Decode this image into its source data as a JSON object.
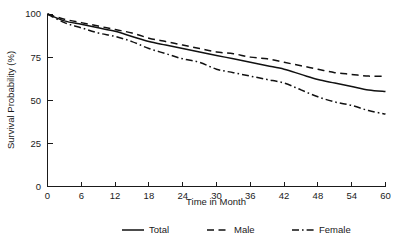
{
  "chart_data": {
    "type": "line",
    "title": "",
    "subtitle": "",
    "xlabel": "Time in Month",
    "ylabel": "Survival Probability (%)",
    "xlim": [
      0,
      60
    ],
    "ylim": [
      0,
      100
    ],
    "xticks": [
      0,
      6,
      12,
      18,
      24,
      30,
      36,
      42,
      48,
      54,
      60
    ],
    "xtick_labels": [
      "0",
      "6",
      "12",
      "18",
      "24",
      "30",
      "36",
      "42",
      "48",
      "54",
      "60"
    ],
    "yticks": [
      0,
      25,
      50,
      75,
      100
    ],
    "ytick_labels": [
      "0",
      "25",
      "50",
      "75",
      "100"
    ],
    "grid": false,
    "legend_position": "bottom",
    "x": [
      0,
      3,
      6,
      9,
      12,
      15,
      18,
      21,
      24,
      27,
      30,
      33,
      36,
      39,
      42,
      45,
      48,
      51,
      54,
      57,
      60
    ],
    "series": [
      {
        "name": "Total",
        "style": "solid",
        "color": "#111111",
        "values": [
          100,
          96,
          94,
          92,
          90,
          87,
          84,
          82,
          80,
          78,
          76,
          74,
          72,
          70,
          68,
          65,
          62,
          60,
          58,
          56,
          55
        ]
      },
      {
        "name": "Male",
        "style": "dashed",
        "color": "#111111",
        "values": [
          100,
          97,
          95,
          93,
          91,
          89,
          86,
          84,
          82,
          80,
          78,
          77,
          75,
          74,
          72,
          70,
          68,
          66,
          65,
          64,
          64
        ]
      },
      {
        "name": "Female",
        "style": "dashdot",
        "color": "#111111",
        "values": [
          100,
          95,
          92,
          89,
          87,
          84,
          80,
          77,
          74,
          72,
          68,
          66,
          64,
          62,
          60,
          56,
          52,
          49,
          47,
          44,
          42
        ]
      }
    ]
  },
  "axes": {
    "y_axis_title": "Survival Probability (%)",
    "x_axis_title": "Time in Month"
  },
  "legend": {
    "items": [
      {
        "label": "Total",
        "style": "solid"
      },
      {
        "label": "Male",
        "style": "dashed"
      },
      {
        "label": "Female",
        "style": "dashdot"
      }
    ]
  }
}
